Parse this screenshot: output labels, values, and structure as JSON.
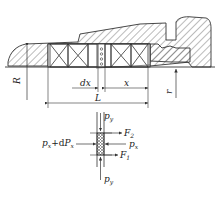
{
  "diagram": {
    "type": "engineering-cross-section",
    "colors": {
      "line": "#333333",
      "hatch": "#555555",
      "background": "#ffffff"
    },
    "section_view": {
      "labels": {
        "R": "R",
        "r": "r",
        "dx": "dx",
        "x": "x",
        "L": "L",
        "bottom_partial": "p"
      },
      "packing_rings_left": 2,
      "packing_rings_right": 2,
      "element_slice": "dx"
    },
    "element_view": {
      "labels": {
        "py_top": "p",
        "py_top_sub": "y",
        "py_bottom": "p",
        "py_bottom_sub": "y",
        "F2": "F",
        "F2_sub": "2",
        "F1": "F",
        "F1_sub": "1",
        "px_right": "p",
        "px_right_sub": "x",
        "px_left_a": "p",
        "px_left_a_sub": "x",
        "px_left_plus": "+d",
        "px_left_b": "P",
        "px_left_b_sub": "x"
      }
    }
  }
}
